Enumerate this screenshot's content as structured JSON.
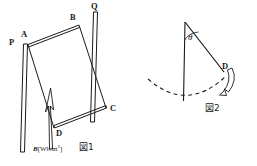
{
  "figure_sheet": {
    "background_color": "#ffffff",
    "ink_color": "#1a1a1a",
    "width": 257,
    "height": 166
  },
  "figure1": {
    "caption": "図1",
    "field_label": {
      "symbol": "B",
      "unit_open": "[Wb/m",
      "exponent": "2",
      "unit_close": "]"
    },
    "vertex_labels": {
      "p": "P",
      "q": "Q",
      "a": "A",
      "b": "B",
      "c": "C",
      "d": "D"
    },
    "description": "Two parallel vertical rails P and Q with a tilted rectangular conducting loop A-B-C-D between them and an upward magnetic field arrow"
  },
  "figure2": {
    "caption": "図2",
    "angle_label": "θ",
    "bob_label": "D",
    "description": "A pendulum rod hanging from a pivot, displaced by angle theta from the vertical, with a dashed swing arc and a curved motion arrow"
  }
}
